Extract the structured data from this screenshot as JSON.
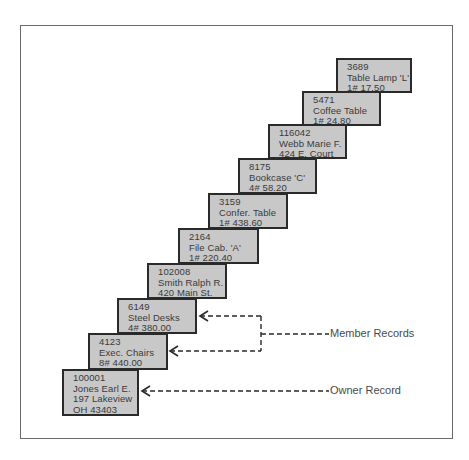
{
  "diagram": {
    "type": "owner-member set (database records)",
    "records": [
      {
        "id": "3689",
        "lines": [
          "3689",
          "Table Lamp 'L'",
          "1#   17.50"
        ],
        "role": "member"
      },
      {
        "id": "5471",
        "lines": [
          "5471",
          "Coffee Table",
          "1#   24.80"
        ],
        "role": "member"
      },
      {
        "id": "116042",
        "lines": [
          "116042",
          "Webb Marie F.",
          "424 E. Court"
        ],
        "role": "owner"
      },
      {
        "id": "8175",
        "lines": [
          "8175",
          "Bookcase 'C'",
          "4#   58.20"
        ],
        "role": "member"
      },
      {
        "id": "3159",
        "lines": [
          "3159",
          "Confer. Table",
          "1#   438.60"
        ],
        "role": "member"
      },
      {
        "id": "2164",
        "lines": [
          "2164",
          "File Cab. 'A'",
          "1#   220.40"
        ],
        "role": "member"
      },
      {
        "id": "102008",
        "lines": [
          "102008",
          "Smith Ralph R.",
          "420 Main St."
        ],
        "role": "owner"
      },
      {
        "id": "6149",
        "lines": [
          "6149",
          "Steel Desks",
          "4#   380.00"
        ],
        "role": "member"
      },
      {
        "id": "4123",
        "lines": [
          "4123",
          "Exec. Chairs",
          "8#   440.00"
        ],
        "role": "member"
      },
      {
        "id": "100001",
        "lines": [
          "100001",
          "Jones Earl E.",
          "197 Lakeview",
          "OH   43403"
        ],
        "role": "owner"
      }
    ],
    "annotations": {
      "member_label": "Member Records",
      "owner_label": "Owner Record"
    },
    "colors": {
      "record_fill": "#c8c8c8",
      "record_border": "#2a2a2a",
      "connector": "#2a2a2a",
      "text": "#3a3a3a"
    }
  }
}
